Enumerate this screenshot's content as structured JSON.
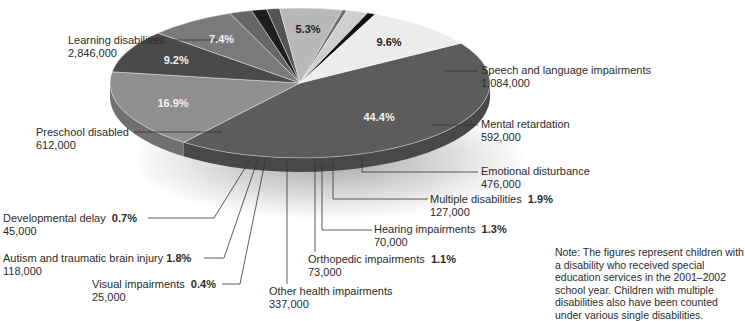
{
  "chart_data": {
    "type": "pie",
    "title": "",
    "style": "3d-exploded-pie",
    "slices": [
      {
        "label": "Learning disabilities",
        "value": 2846000,
        "value_label": "2,846,000",
        "percent": 44.4,
        "percent_label": "44.4%",
        "color": "#5c5c5c"
      },
      {
        "label": "Speech and language impairments",
        "value": 1084000,
        "value_label": "1,084,000",
        "percent": 16.9,
        "percent_label": "16.9%",
        "color": "#8f8f8f"
      },
      {
        "label": "Mental retardation",
        "value": 592000,
        "value_label": "592,000",
        "percent": 9.2,
        "percent_label": "9.2%",
        "color": "#4a4a4a"
      },
      {
        "label": "Emotional disturbance",
        "value": 476000,
        "value_label": "476,000",
        "percent": 7.4,
        "percent_label": "7.4%",
        "color": "#7a7a7a"
      },
      {
        "label": "Multiple disabilities",
        "value": 127000,
        "value_label": "127,000",
        "percent": 1.9,
        "percent_label": "1.9%",
        "color": "#666666"
      },
      {
        "label": "Hearing impairments",
        "value": 70000,
        "value_label": "70,000",
        "percent": 1.3,
        "percent_label": "1.3%",
        "color": "#1e1e1e"
      },
      {
        "label": "Orthopedic impairments",
        "value": 73000,
        "value_label": "73,000",
        "percent": 1.1,
        "percent_label": "1.1%",
        "color": "#545454"
      },
      {
        "label": "Other health impairments",
        "value": 337000,
        "value_label": "337,000",
        "percent": 5.3,
        "percent_label": "5.3%",
        "color": "#b8b8b8"
      },
      {
        "label": "Visual impairments",
        "value": 25000,
        "value_label": "25,000",
        "percent": 0.4,
        "percent_label": "0.4%",
        "color": "#6e6e6e"
      },
      {
        "label": "Autism and traumatic brain injury",
        "value": 118000,
        "value_label": "118,000",
        "percent": 1.8,
        "percent_label": "1.8%",
        "color": "#cfcfcf"
      },
      {
        "label": "Developmental delay",
        "value": 45000,
        "value_label": "45,000",
        "percent": 0.7,
        "percent_label": "0.7%",
        "color": "#111111"
      },
      {
        "label": "Preschool disabled",
        "value": 612000,
        "value_label": "612,000",
        "percent": 9.6,
        "percent_label": "9.6%",
        "color": "#ececec"
      }
    ],
    "legend": "none (leader-line callouts)",
    "annotations": [
      "Note: The figures represent children with a disability who received special education services in the 2001–2002 school year. Children with multiple disabilities also have been counted under various single disabilities."
    ]
  },
  "labels": {
    "learning": {
      "name": "Learning disabilities",
      "value": "2,846,000"
    },
    "speech": {
      "name": "Speech and language impairments",
      "value": "1,084,000"
    },
    "mental": {
      "name": "Mental retardation",
      "value": "592,000"
    },
    "emotional": {
      "name": "Emotional disturbance",
      "value": "476,000"
    },
    "multiple": {
      "name": "Multiple disabilities",
      "pct": "1.9%",
      "value": "127,000"
    },
    "hearing": {
      "name": "Hearing impairments",
      "pct": "1.3%",
      "value": "70,000"
    },
    "orthopedic": {
      "name": "Orthopedic impairments",
      "pct": "1.1%",
      "value": "73,000"
    },
    "other": {
      "name": "Other health impairments",
      "value": "337,000"
    },
    "visual": {
      "name": "Visual impairments",
      "pct": "0.4%",
      "value": "25,000"
    },
    "autism": {
      "name": "Autism and traumatic brain injury",
      "pct": "1.8%",
      "value": "118,000"
    },
    "developmental": {
      "name": "Developmental delay",
      "pct": "0.7%",
      "value": "45,000"
    },
    "preschool": {
      "name": "Preschool disabled",
      "value": "612,000"
    }
  },
  "in_pie_percents": {
    "learning": "44.4%",
    "speech": "16.9%",
    "mental": "9.2%",
    "emotional": "7.4%",
    "other": "5.3%",
    "preschool": "9.6%"
  },
  "note": "Note: The figures represent children with a disability who received special education services in the 2001–2002 school year. Children with multiple disabilities also have been counted under various single disabilities."
}
